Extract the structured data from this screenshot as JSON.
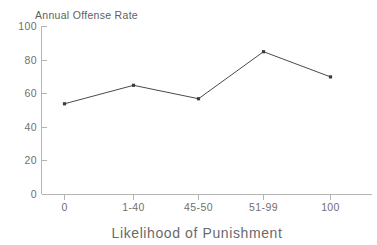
{
  "chart_data": {
    "type": "line",
    "title": "",
    "categories": [
      "0",
      "1-40",
      "45-50",
      "51-99",
      "100"
    ],
    "values": [
      54,
      65,
      57,
      85,
      70
    ],
    "xlabel": "Likelihood of Punishment",
    "ylabel": "Annual Offense Rate",
    "ylabel_position": "above-axis",
    "ylim": [
      0,
      100
    ],
    "yticks": [
      0,
      20,
      40,
      60,
      80,
      100
    ],
    "ytick_labels": [
      "0",
      "20",
      "40",
      "60",
      "80",
      "100"
    ],
    "xtick_labels": [
      "0",
      "1-40",
      "45-50",
      "51-99",
      "100"
    ],
    "grid": false,
    "legend": null,
    "marker": "square",
    "colors": {
      "line": "#4a4a4a",
      "marker": "#3c3c3c",
      "axis": "#b4b4b4",
      "tick_text": "#6f6f6f",
      "axis_title": "#6a6a6a",
      "background": "#ffffff"
    }
  },
  "axis_title_y": "Annual Offense Rate",
  "axis_title_x": "Likelihood of Punishment"
}
